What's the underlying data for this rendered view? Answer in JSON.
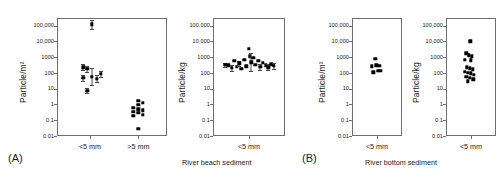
{
  "figure": {
    "panel_a_letter": "(A)",
    "panel_b_letter": "(B)",
    "caption_beach": "River beach sediment",
    "caption_bottom": "River bottom sediment"
  },
  "axis": {
    "ticks": [
      "100,000",
      "10,000",
      "1000",
      "100",
      "10",
      "1",
      "0.1",
      "0.01"
    ],
    "ylabel_area": "Particle/m²",
    "ylabel_mass": "Particle/kg",
    "xcat_small": "<5 mm",
    "xcat_large": ">5 mm"
  },
  "chart_data": [
    {
      "type": "scatter",
      "id": "panel-a-area",
      "title": "",
      "xlabel": "",
      "ylabel": "Particle/m²",
      "yscale": "log",
      "ylim": [
        0.01,
        300000
      ],
      "ytick_values": [
        100000,
        10000,
        1000,
        100,
        10,
        1,
        0.1,
        0.01
      ],
      "ytick_labels": [
        "100,000",
        "10,000",
        "1000",
        "100",
        "10",
        "1",
        "0.1",
        "0.01"
      ],
      "categories": [
        "<5 mm",
        ">5 mm"
      ],
      "grid": false,
      "legend": false,
      "series": [
        {
          "name": "<5 mm",
          "category": "<5 mm",
          "points": [
            {
              "xoff": -0.2,
              "y": 230,
              "err_low": 150,
              "err_high": 360
            },
            {
              "xoff": -0.2,
              "y": 48,
              "err_low": 30,
              "err_high": 78
            },
            {
              "xoff": -0.08,
              "y": 180,
              "err_low": 120,
              "err_high": 270
            },
            {
              "xoff": -0.08,
              "y": 7.5,
              "err_low": 5.0,
              "err_high": 11
            },
            {
              "xoff": 0.06,
              "y": 120000,
              "err_low": 60000,
              "err_high": 230000
            },
            {
              "xoff": 0.06,
              "y": 58,
              "err_low": 17,
              "err_high": 190
            },
            {
              "xoff": 0.2,
              "y": 42,
              "err_low": 25,
              "err_high": 70
            },
            {
              "xoff": 0.33,
              "y": 85,
              "err_low": 55,
              "err_high": 130
            }
          ]
        },
        {
          "name": ">5 mm",
          "category": ">5 mm",
          "points": [
            {
              "xoff": -0.16,
              "y": 0.6,
              "err_low": null,
              "err_high": null
            },
            {
              "xoff": -0.16,
              "y": 0.33,
              "err_low": null,
              "err_high": null
            },
            {
              "xoff": -0.16,
              "y": 0.19,
              "err_low": null,
              "err_high": null
            },
            {
              "xoff": 0.0,
              "y": 1.7,
              "err_low": null,
              "err_high": null
            },
            {
              "xoff": 0.0,
              "y": 0.95,
              "err_low": null,
              "err_high": null
            },
            {
              "xoff": 0.0,
              "y": 0.48,
              "err_low": null,
              "err_high": null
            },
            {
              "xoff": 0.0,
              "y": 0.3,
              "err_low": null,
              "err_high": null
            },
            {
              "xoff": 0.0,
              "y": 0.028,
              "err_low": null,
              "err_high": null
            },
            {
              "xoff": 0.14,
              "y": 1.25,
              "err_low": null,
              "err_high": null
            },
            {
              "xoff": 0.14,
              "y": 0.42,
              "err_low": null,
              "err_high": null
            },
            {
              "xoff": 0.14,
              "y": 0.22,
              "err_low": null,
              "err_high": null
            }
          ]
        }
      ]
    },
    {
      "type": "scatter",
      "id": "panel-a-mass",
      "title": "",
      "xlabel": "",
      "ylabel": "Particle/kg",
      "yscale": "log",
      "ylim": [
        0.01,
        300000
      ],
      "ytick_values": [
        100000,
        10000,
        1000,
        100,
        10,
        1,
        0.1,
        0.01
      ],
      "ytick_labels": [
        "100,000",
        "10,000",
        "1000",
        "100",
        "10",
        "1",
        "0.1",
        "0.01"
      ],
      "categories": [
        "<5 mm"
      ],
      "grid": false,
      "legend": false,
      "series": [
        {
          "name": "<5 mm",
          "category": "<5 mm",
          "points": [
            {
              "xoff": -0.44,
              "y": 320,
              "err_low": 230,
              "err_high": 450
            },
            {
              "xoff": -0.38,
              "y": 300,
              "err_low": null,
              "err_high": null
            },
            {
              "xoff": -0.32,
              "y": 210,
              "err_low": 140,
              "err_high": 310
            },
            {
              "xoff": -0.27,
              "y": 600,
              "err_low": null,
              "err_high": null
            },
            {
              "xoff": -0.23,
              "y": 250,
              "err_low": null,
              "err_high": null
            },
            {
              "xoff": -0.18,
              "y": 400,
              "err_low": 280,
              "err_high": 580
            },
            {
              "xoff": -0.14,
              "y": 180,
              "err_low": null,
              "err_high": null
            },
            {
              "xoff": -0.09,
              "y": 700,
              "err_low": null,
              "err_high": null
            },
            {
              "xoff": -0.05,
              "y": 260,
              "err_low": null,
              "err_high": null
            },
            {
              "xoff": 0.0,
              "y": 3500,
              "err_low": null,
              "err_high": null
            },
            {
              "xoff": 0.02,
              "y": 1100,
              "err_low": null,
              "err_high": null
            },
            {
              "xoff": 0.04,
              "y": 480,
              "err_low": 130,
              "err_high": 1700
            },
            {
              "xoff": 0.08,
              "y": 900,
              "err_low": null,
              "err_high": null
            },
            {
              "xoff": 0.12,
              "y": 330,
              "err_low": null,
              "err_high": null
            },
            {
              "xoff": 0.17,
              "y": 600,
              "err_low": null,
              "err_high": null
            },
            {
              "xoff": 0.21,
              "y": 250,
              "err_low": 160,
              "err_high": 390
            },
            {
              "xoff": 0.26,
              "y": 420,
              "err_low": null,
              "err_high": null
            },
            {
              "xoff": 0.31,
              "y": 300,
              "err_low": null,
              "err_high": null
            },
            {
              "xoff": 0.36,
              "y": 230,
              "err_low": 150,
              "err_high": 350
            },
            {
              "xoff": 0.41,
              "y": 340,
              "err_low": null,
              "err_high": null
            },
            {
              "xoff": 0.46,
              "y": 270,
              "err_low": 170,
              "err_high": 420
            }
          ]
        }
      ]
    },
    {
      "type": "scatter",
      "id": "panel-b-area",
      "title": "",
      "xlabel": "",
      "ylabel": "Particle/m²",
      "yscale": "log",
      "ylim": [
        0.01,
        300000
      ],
      "ytick_values": [
        100000,
        10000,
        1000,
        100,
        10,
        1,
        0.1,
        0.01
      ],
      "ytick_labels": [
        "100,000",
        "10,000",
        "1000",
        "100",
        "10",
        "1",
        "0.1",
        "0.01"
      ],
      "categories": [
        "<5 mm"
      ],
      "grid": false,
      "legend": false,
      "series": [
        {
          "name": "<5 mm",
          "category": "<5 mm",
          "points": [
            {
              "xoff": -0.05,
              "y": 800,
              "err_low": null,
              "err_high": null
            },
            {
              "xoff": -0.14,
              "y": 260,
              "err_low": null,
              "err_high": null
            },
            {
              "xoff": -0.02,
              "y": 300,
              "err_low": null,
              "err_high": null
            },
            {
              "xoff": 0.06,
              "y": 280,
              "err_low": null,
              "err_high": null
            },
            {
              "xoff": -0.1,
              "y": 110,
              "err_low": null,
              "err_high": null
            },
            {
              "xoff": 0.02,
              "y": 140,
              "err_low": null,
              "err_high": null
            },
            {
              "xoff": 0.09,
              "y": 130,
              "err_low": null,
              "err_high": null
            }
          ]
        }
      ]
    },
    {
      "type": "scatter",
      "id": "panel-b-mass",
      "title": "",
      "xlabel": "",
      "ylabel": "Particle/kg",
      "yscale": "log",
      "ylim": [
        0.01,
        300000
      ],
      "ytick_values": [
        100000,
        10000,
        1000,
        100,
        10,
        1,
        0.1,
        0.01
      ],
      "ytick_labels": [
        "100,000",
        "10,000",
        "1000",
        "100",
        "10",
        "1",
        "0.1",
        "0.01"
      ],
      "categories": [
        "<5 mm"
      ],
      "grid": false,
      "legend": false,
      "series": [
        {
          "name": "<5 mm",
          "category": "<5 mm",
          "points": [
            {
              "xoff": -0.02,
              "y": 10000,
              "err_low": null,
              "err_high": null
            },
            {
              "xoff": -0.13,
              "y": 1700,
              "err_low": null,
              "err_high": null
            },
            {
              "xoff": -0.06,
              "y": 1300,
              "err_low": null,
              "err_high": null
            },
            {
              "xoff": 0.02,
              "y": 1100,
              "err_low": null,
              "err_high": null
            },
            {
              "xoff": -0.17,
              "y": 700,
              "err_low": null,
              "err_high": null
            },
            {
              "xoff": 0.0,
              "y": 620,
              "err_low": null,
              "err_high": null
            },
            {
              "xoff": -0.12,
              "y": 230,
              "err_low": null,
              "err_high": null
            },
            {
              "xoff": -0.03,
              "y": 200,
              "err_low": null,
              "err_high": null
            },
            {
              "xoff": 0.05,
              "y": 170,
              "err_low": null,
              "err_high": null
            },
            {
              "xoff": -0.16,
              "y": 120,
              "err_low": null,
              "err_high": null
            },
            {
              "xoff": -0.09,
              "y": 105,
              "err_low": null,
              "err_high": null
            },
            {
              "xoff": -0.01,
              "y": 95,
              "err_low": null,
              "err_high": null
            },
            {
              "xoff": 0.07,
              "y": 75,
              "err_low": null,
              "err_high": null
            },
            {
              "xoff": -0.13,
              "y": 55,
              "err_low": null,
              "err_high": null
            },
            {
              "xoff": -0.04,
              "y": 48,
              "err_low": null,
              "err_high": null
            },
            {
              "xoff": 0.06,
              "y": 40,
              "err_low": null,
              "err_high": null
            },
            {
              "xoff": -0.08,
              "y": 30,
              "err_low": null,
              "err_high": null
            }
          ]
        }
      ]
    }
  ]
}
